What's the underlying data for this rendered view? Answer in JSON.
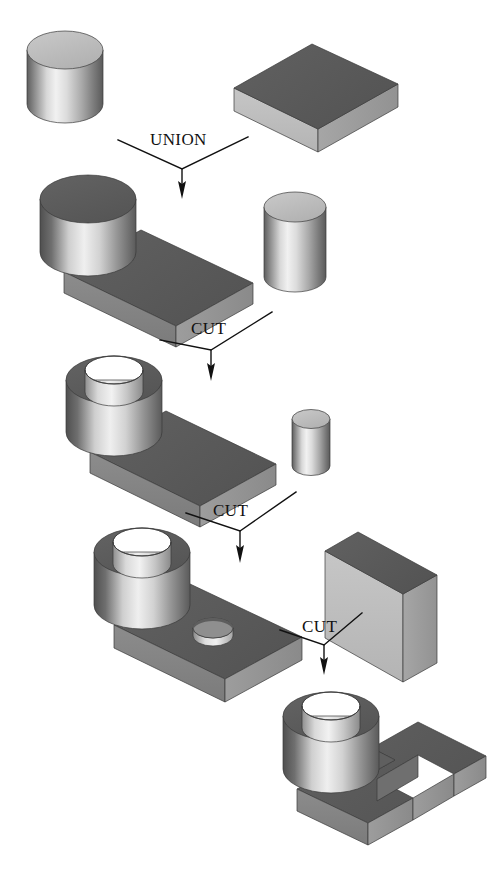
{
  "figure": {
    "background_color": "#ffffff",
    "width": 489,
    "height": 873
  },
  "operations": [
    {
      "id": "op-union",
      "label": "UNION",
      "label_x": 150,
      "label_y": 145,
      "vertex_x": 182,
      "vertex_y": 169,
      "left_x": 118,
      "left_y": 140,
      "right_x": 248,
      "right_y": 137,
      "arrow_tip_y": 196
    },
    {
      "id": "op-cut-1",
      "label": "CUT",
      "label_x": 191,
      "label_y": 334,
      "vertex_x": 211,
      "vertex_y": 350,
      "left_x": 160,
      "left_y": 340,
      "right_x": 272,
      "right_y": 312,
      "arrow_tip_y": 378
    },
    {
      "id": "op-cut-2",
      "label": "CUT",
      "label_x": 213,
      "label_y": 516,
      "vertex_x": 240,
      "vertex_y": 531,
      "left_x": 186,
      "left_y": 513,
      "right_x": 296,
      "right_y": 492,
      "arrow_tip_y": 560
    },
    {
      "id": "op-cut-3",
      "label": "CUT",
      "label_x": 302,
      "label_y": 632,
      "vertex_x": 324,
      "vertex_y": 645,
      "left_x": 280,
      "left_y": 630,
      "right_x": 362,
      "right_y": 613,
      "arrow_tip_y": 672
    }
  ],
  "solids": [
    {
      "id": "cylinder-a",
      "name": "cylinder-primitive",
      "kind": "cylinder",
      "row": 1,
      "role": "operand-left"
    },
    {
      "id": "box-a",
      "name": "box-primitive",
      "kind": "box",
      "row": 1,
      "role": "operand-right"
    },
    {
      "id": "union-result",
      "name": "cylinder-on-plate",
      "kind": "union-solid",
      "row": 2,
      "role": "result"
    },
    {
      "id": "cylinder-b",
      "name": "bore-tool-cylinder",
      "kind": "cylinder",
      "row": 2,
      "role": "operand-right"
    },
    {
      "id": "cut1-result",
      "name": "bored-cylinder-on-plate",
      "kind": "cut-solid",
      "row": 3,
      "role": "result"
    },
    {
      "id": "cylinder-c",
      "name": "small-hole-tool-cylinder",
      "kind": "cylinder",
      "row": 3,
      "role": "operand-right"
    },
    {
      "id": "cut2-result",
      "name": "plate-with-small-hole",
      "kind": "cut-solid",
      "row": 4,
      "role": "result"
    },
    {
      "id": "box-b",
      "name": "slot-tool-box",
      "kind": "box",
      "row": 4,
      "role": "operand-right"
    },
    {
      "id": "final-result",
      "name": "final-slotted-part",
      "kind": "cut-solid",
      "row": 5,
      "role": "result"
    }
  ],
  "palette": {
    "top_dark": "#5a5a5a",
    "top_dark_2": "#636363",
    "face_light": "#c2c2c2",
    "face_mid": "#a0a0a0",
    "face_dark": "#6e6e6e",
    "cyl_light": "#e8e8e8",
    "cyl_shadow": "#6a6a6a",
    "edge": "#3a3a3a",
    "ink": "#111111",
    "paper": "#ffffff"
  }
}
